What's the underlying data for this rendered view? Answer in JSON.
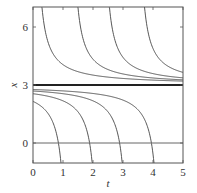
{
  "chart_data": {
    "type": "line",
    "title": "",
    "xlabel": "t",
    "ylabel": "x",
    "xlim": [
      0,
      5
    ],
    "ylim": [
      -1,
      6.9
    ],
    "xticks": [
      "0",
      "1",
      "2",
      "3",
      "4",
      "5"
    ],
    "yticks": [
      "0",
      "3",
      "6"
    ],
    "grid": false,
    "legend": null,
    "equilibria": [
      {
        "x": 3,
        "style": "thick",
        "label": "x = 3"
      },
      {
        "x": 0,
        "style": "thin",
        "label": "x = 0"
      }
    ],
    "model": "x = 3 + 1/(t - c)",
    "series": [
      {
        "name": "upper-1",
        "c": 0.05,
        "side": "above"
      },
      {
        "name": "upper-2",
        "c": 1.25,
        "side": "above"
      },
      {
        "name": "upper-3",
        "c": 2.3,
        "side": "above"
      },
      {
        "name": "upper-4",
        "c": 3.47,
        "side": "above"
      },
      {
        "name": "lower-1",
        "c": 1.18,
        "side": "below"
      },
      {
        "name": "lower-2",
        "c": 2.22,
        "side": "below"
      },
      {
        "name": "lower-3",
        "c": 3.22,
        "side": "below"
      },
      {
        "name": "lower-4",
        "c": 4.28,
        "side": "below"
      }
    ]
  }
}
